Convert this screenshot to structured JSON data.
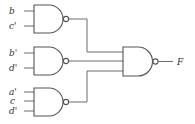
{
  "diagram": {
    "type": "logic-circuit",
    "gate_type": "NAND",
    "gates": [
      {
        "id": "g1",
        "inputs": [
          "b",
          "c'"
        ]
      },
      {
        "id": "g2",
        "inputs": [
          "b'",
          "d'"
        ]
      },
      {
        "id": "g3",
        "inputs": [
          "a'",
          "c",
          "d'"
        ]
      },
      {
        "id": "g4",
        "inputs": [
          "g1",
          "g2",
          "g3"
        ],
        "output": "F"
      }
    ],
    "labels": {
      "g1_in1": "b",
      "g1_in2": "c'",
      "g2_in1": "b'",
      "g2_in2": "d'",
      "g3_in1": "a'",
      "g3_in2": "c",
      "g3_in3": "d'",
      "output": "F"
    },
    "colors": {
      "line": "#555555",
      "text": "#333333"
    }
  }
}
